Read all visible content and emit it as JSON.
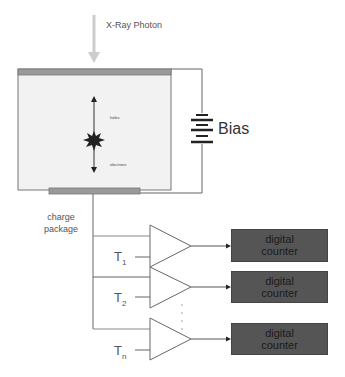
{
  "diagram": {
    "photon_label": "X-Ray Photon",
    "detector": {
      "holes_label": "holes",
      "electrons_label": "electrons"
    },
    "bias_label": "Bias",
    "charge_label_line1": "charge",
    "charge_label_line2": "package",
    "channels": [
      {
        "threshold": "T",
        "sub": "1",
        "counter_line1": "digital",
        "counter_line2": "counter"
      },
      {
        "threshold": "T",
        "sub": "2",
        "counter_line1": "digital",
        "counter_line2": "counter"
      },
      {
        "threshold": "T",
        "sub": "n",
        "counter_line1": "digital",
        "counter_line2": "counter"
      }
    ],
    "colors": {
      "detector_fill": "#f2f2f2",
      "electrode": "#9a9a9a",
      "counter_fill": "#555555",
      "wire": "#666666",
      "photon_arrow": "#cccccc"
    }
  }
}
